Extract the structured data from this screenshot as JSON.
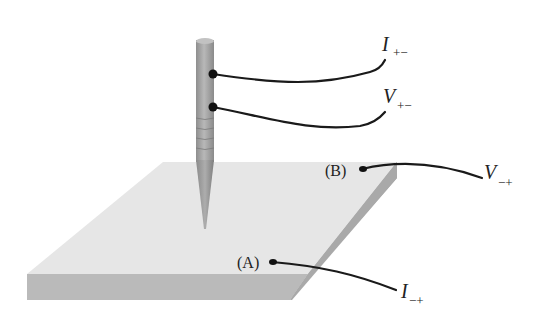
{
  "diagram": {
    "type": "four-point probe measurement schematic",
    "probe": {
      "contacts": [
        {
          "id": "I_pm",
          "label_main": "I",
          "label_sub": "+−"
        },
        {
          "id": "V_pm",
          "label_main": "V",
          "label_sub": "+−"
        }
      ]
    },
    "sample": {
      "contacts": [
        {
          "id": "B",
          "point_label": "(B)",
          "label_main": "V",
          "label_sub": "−+"
        },
        {
          "id": "A",
          "point_label": "(A)",
          "label_main": "I",
          "label_sub": "−+"
        }
      ]
    },
    "colors": {
      "plate_top": "#e6e6e6",
      "plate_front": "#b9b9b9",
      "plate_side": "#a8a8a8",
      "probe": "#a0a0a0",
      "wire": "#1a1a1a"
    }
  }
}
